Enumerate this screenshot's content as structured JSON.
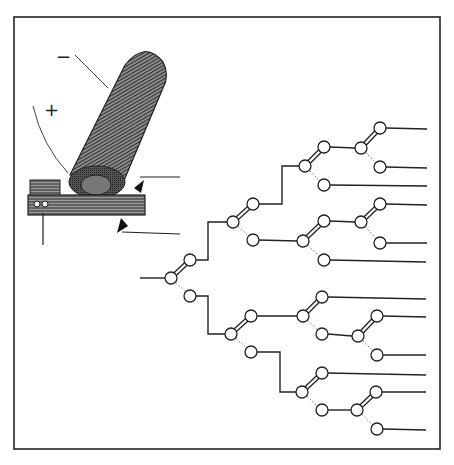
{
  "figure": {
    "frame": {
      "x": 14,
      "y": 17,
      "w": 426,
      "h": 432
    },
    "colors": {
      "ink": "#222222",
      "paper": "#ffffff",
      "coil_dark": "#333333",
      "coil_light": "#8a8a8a",
      "dotted": "#777777"
    }
  },
  "coil": {
    "minus_label": "−",
    "plus_label": "+"
  },
  "switches": [
    {
      "id": "s0",
      "pivot": [
        171,
        278
      ],
      "upper": [
        190,
        260
      ],
      "lower": [
        190,
        296
      ]
    },
    {
      "id": "s1a",
      "pivot": [
        233,
        222
      ],
      "upper": [
        253,
        204
      ],
      "lower": [
        253,
        240
      ]
    },
    {
      "id": "s2a",
      "pivot": [
        305,
        166
      ],
      "upper": [
        324,
        147
      ],
      "lower": [
        324,
        185
      ]
    },
    {
      "id": "s3a",
      "pivot": [
        361,
        148
      ],
      "upper": [
        380,
        128
      ],
      "lower": [
        380,
        167
      ]
    },
    {
      "id": "s2b",
      "pivot": [
        303,
        241
      ],
      "upper": [
        324,
        221
      ],
      "lower": [
        324,
        260
      ]
    },
    {
      "id": "s3b",
      "pivot": [
        361,
        222
      ],
      "upper": [
        380,
        204
      ],
      "lower": [
        380,
        243
      ]
    },
    {
      "id": "s1b",
      "pivot": [
        231,
        334
      ],
      "upper": [
        251,
        316
      ],
      "lower": [
        251,
        352
      ]
    },
    {
      "id": "s2c",
      "pivot": [
        303,
        316
      ],
      "upper": [
        322,
        297
      ],
      "lower": [
        322,
        334
      ]
    },
    {
      "id": "s3c",
      "pivot": [
        358,
        336
      ],
      "upper": [
        377,
        316
      ],
      "lower": [
        377,
        355
      ]
    },
    {
      "id": "s2d",
      "pivot": [
        302,
        392
      ],
      "upper": [
        322,
        373
      ],
      "lower": [
        322,
        410
      ]
    },
    {
      "id": "s3d",
      "pivot": [
        357,
        410
      ],
      "upper": [
        376,
        392
      ],
      "lower": [
        377,
        429
      ]
    }
  ],
  "wires": [
    [
      [
        140,
        278
      ],
      [
        165,
        278
      ]
    ],
    [
      [
        196,
        260
      ],
      [
        208,
        260
      ],
      [
        208,
        222
      ],
      [
        227,
        222
      ]
    ],
    [
      [
        259,
        204
      ],
      [
        282,
        204
      ],
      [
        282,
        166
      ],
      [
        299,
        166
      ]
    ],
    [
      [
        330,
        147
      ],
      [
        355,
        148
      ]
    ],
    [
      [
        386,
        128
      ],
      [
        427,
        129
      ]
    ],
    [
      [
        386,
        167
      ],
      [
        427,
        168
      ]
    ],
    [
      [
        330,
        185
      ],
      [
        427,
        186
      ]
    ],
    [
      [
        259,
        240
      ],
      [
        297,
        241
      ]
    ],
    [
      [
        330,
        221
      ],
      [
        355,
        222
      ]
    ],
    [
      [
        386,
        204
      ],
      [
        427,
        205
      ]
    ],
    [
      [
        386,
        243
      ],
      [
        427,
        243
      ]
    ],
    [
      [
        330,
        260
      ],
      [
        426,
        262
      ]
    ],
    [
      [
        196,
        296
      ],
      [
        208,
        296
      ],
      [
        208,
        334
      ],
      [
        225,
        334
      ]
    ],
    [
      [
        257,
        316
      ],
      [
        297,
        316
      ]
    ],
    [
      [
        328,
        297
      ],
      [
        426,
        299
      ]
    ],
    [
      [
        328,
        334
      ],
      [
        352,
        336
      ]
    ],
    [
      [
        383,
        316
      ],
      [
        426,
        317
      ]
    ],
    [
      [
        383,
        355
      ],
      [
        426,
        355
      ]
    ],
    [
      [
        257,
        352
      ],
      [
        280,
        352
      ],
      [
        280,
        392
      ],
      [
        296,
        392
      ]
    ],
    [
      [
        328,
        373
      ],
      [
        426,
        375
      ]
    ],
    [
      [
        328,
        410
      ],
      [
        351,
        410
      ]
    ],
    [
      [
        382,
        392
      ],
      [
        426,
        392
      ]
    ],
    [
      [
        383,
        429
      ],
      [
        426,
        430
      ]
    ]
  ],
  "coil_leads": [
    [
      [
        140,
        177
      ],
      [
        180,
        177
      ]
    ],
    [
      [
        122,
        232
      ],
      [
        180,
        234
      ]
    ],
    [
      [
        43,
        213
      ],
      [
        43,
        245
      ]
    ]
  ]
}
